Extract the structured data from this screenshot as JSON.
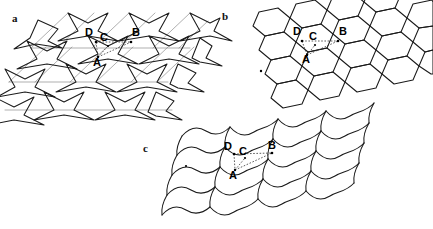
{
  "figure": {
    "background_color": "#ffffff",
    "line_color": "#1a1a1a",
    "back_line_color": "#8d8d8d",
    "connector_color": "#333333",
    "width": 433,
    "height": 229
  },
  "panels": [
    {
      "id": "a",
      "letter": "a",
      "name": "re-entrant-auxetic-honeycomb",
      "description": "Re-entrant arrowhead honeycomb lattice in oblique projection",
      "letter_x": 12,
      "letter_y": 22,
      "vertex_labels": [
        {
          "text": "D",
          "x": 89,
          "y": 36
        },
        {
          "text": "C",
          "x": 103,
          "y": 41
        },
        {
          "text": "B",
          "x": 135,
          "y": 36
        },
        {
          "text": "A",
          "x": 97,
          "y": 63
        }
      ]
    },
    {
      "id": "b",
      "letter": "b",
      "name": "regular-hexagonal-honeycomb",
      "description": "Regular hexagonal honeycomb lattice in oblique projection",
      "letter_x": 222,
      "letter_y": 20,
      "vertex_labels": [
        {
          "text": "D",
          "x": 297,
          "y": 35
        },
        {
          "text": "C",
          "x": 312,
          "y": 40
        },
        {
          "text": "B",
          "x": 342,
          "y": 35
        },
        {
          "text": "A",
          "x": 306,
          "y": 60
        }
      ]
    },
    {
      "id": "c",
      "letter": "c",
      "name": "curved-wavy-quadrilateral-lattice",
      "description": "Curved sinusoidal quadrilateral cell lattice in oblique projection",
      "letter_x": 143,
      "letter_y": 152,
      "vertex_labels": [
        {
          "text": "D",
          "x": 227,
          "y": 150
        },
        {
          "text": "C",
          "x": 241,
          "y": 155
        },
        {
          "text": "B",
          "x": 270,
          "y": 149
        },
        {
          "text": "A",
          "x": 233,
          "y": 176
        }
      ]
    }
  ]
}
